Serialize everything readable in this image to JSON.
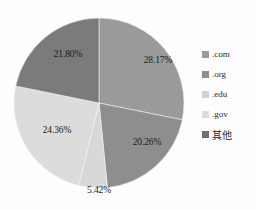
{
  "chart_data": {
    "type": "pie",
    "title": "",
    "categories": [
      ".com",
      ".org",
      ".edu",
      ".gov",
      "其他"
    ],
    "values": [
      28.17,
      20.26,
      5.42,
      24.36,
      21.8
    ],
    "value_labels": [
      "28.17%",
      "20.26%",
      "5.42%",
      "24.36%",
      "21.80%"
    ],
    "colors": [
      "#9a9a9a",
      "#8e8e8e",
      "#d8d8d8",
      "#dcdcdc",
      "#7b7b7b"
    ],
    "unit": "%",
    "start_angle_deg": 0,
    "direction": "clockwise",
    "legend_position": "right",
    "grid": false,
    "background": "#fefefe"
  },
  "legend": {
    "items": [
      {
        "label": ".com",
        "color": "#9a9a9a"
      },
      {
        "label": ".org",
        "color": "#8e8e8e"
      },
      {
        "label": ".edu",
        "color": "#d0d0d0"
      },
      {
        "label": ".gov",
        "color": "#dcdcdc"
      },
      {
        "label": "其他",
        "color": "#6f6f6f"
      }
    ]
  },
  "labels": {
    "com": "28.17%",
    "org": "20.26%",
    "edu": "5.42%",
    "gov": "24.36%",
    "other": "21.80%"
  }
}
